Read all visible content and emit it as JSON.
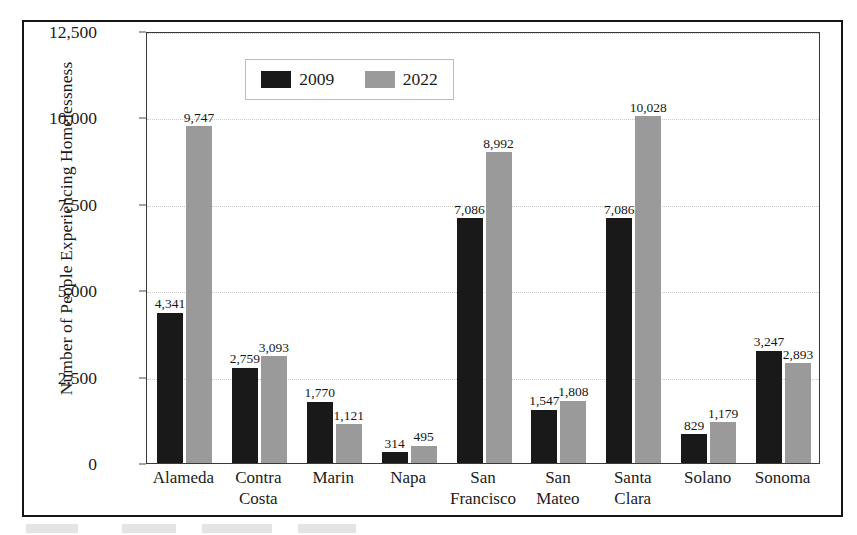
{
  "chart_data": {
    "type": "bar",
    "title": "",
    "xlabel": "",
    "ylabel": "Number of People Experiencing Homelessness",
    "ylim": [
      0,
      12500
    ],
    "ytick_labels": [
      "0",
      "2,500",
      "5,000",
      "7,500",
      "10,000",
      "12,500"
    ],
    "ytick_values": [
      0,
      2500,
      5000,
      7500,
      10000,
      12500
    ],
    "grid": true,
    "legend_position": "top-center-inside",
    "categories": [
      "Alameda",
      "Contra\nCosta",
      "Marin",
      "Napa",
      "San\nFrancisco",
      "San\nMateo",
      "Santa\nClara",
      "Solano",
      "Sonoma"
    ],
    "series": [
      {
        "name": "2009",
        "color": "#191919",
        "values": [
          4341,
          2759,
          1770,
          314,
          7086,
          1547,
          7086,
          829,
          3247
        ],
        "labels": [
          "4,341",
          "2,759",
          "1,770",
          "314",
          "7,086",
          "1,547",
          "7,086",
          "829",
          "3,247"
        ]
      },
      {
        "name": "2022",
        "color": "#9a9a9a",
        "values": [
          9747,
          3093,
          1121,
          495,
          8992,
          1808,
          10028,
          1179,
          2893
        ],
        "labels": [
          "9,747",
          "3,093",
          "1,121",
          "495",
          "8,992",
          "1,808",
          "10,028",
          "1,179",
          "2,893"
        ]
      }
    ]
  },
  "legend": {
    "items": [
      {
        "label": "2009",
        "color": "#191919"
      },
      {
        "label": "2022",
        "color": "#9a9a9a"
      }
    ]
  }
}
